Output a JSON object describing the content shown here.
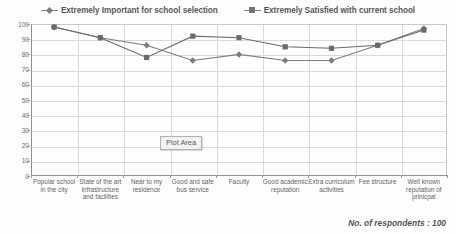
{
  "chart_data": {
    "type": "line",
    "title": "",
    "xlabel": "",
    "ylabel": "",
    "ylim": [
      0,
      100
    ],
    "ytick_step": 10,
    "grid": true,
    "legend_position": "top-center",
    "annotation": "No. of respondents : 100",
    "tooltip": "Plot Area",
    "categories": [
      "Popular school in the city",
      "State of the art infrastructure and facilities",
      "Near to my residence",
      "Good and safe bus service",
      "Faculty",
      "Good academic reputation",
      "Extra curriculum activities",
      "Fee structure",
      "Well known reputation of prinicpal"
    ],
    "yticks": [
      100,
      90,
      80,
      70,
      60,
      50,
      40,
      30,
      20,
      10,
      0
    ],
    "series": [
      {
        "name": "Extremely Important for school selection",
        "marker": "diamond",
        "color": "#555555",
        "values": [
          98,
          91,
          86,
          76,
          80,
          76,
          76,
          86,
          97
        ]
      },
      {
        "name": "Extremely Satisfied with current school",
        "marker": "square",
        "color": "#3d3d3d",
        "values": [
          98,
          91,
          78,
          92,
          91,
          85,
          84,
          86,
          96
        ]
      }
    ]
  }
}
